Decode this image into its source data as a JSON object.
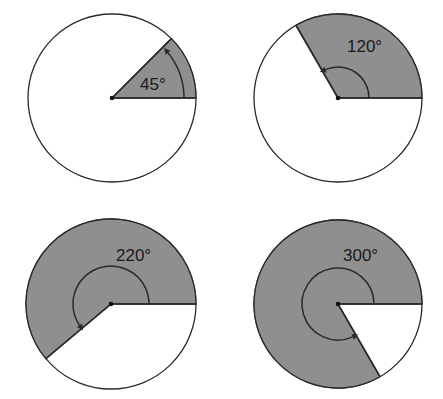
{
  "colors": {
    "background": "#ffffff",
    "sector_fill": "#8f8f8f",
    "stroke": "#2a2a2a"
  },
  "figures": [
    {
      "id": "angle-45",
      "angle_degrees": 45,
      "label": "45°",
      "center": [
        112,
        98
      ],
      "radius": 84,
      "arc_radius": 72,
      "label_pos": [
        140,
        90
      ]
    },
    {
      "id": "angle-120",
      "angle_degrees": 120,
      "label": "120°",
      "center": [
        338,
        98
      ],
      "radius": 84,
      "arc_radius": 31,
      "label_pos": [
        347,
        52
      ]
    },
    {
      "id": "angle-220",
      "angle_degrees": 220,
      "label": "220°",
      "center": [
        111,
        304
      ],
      "radius": 85,
      "arc_radius": 38,
      "label_pos": [
        116,
        261
      ]
    },
    {
      "id": "angle-300",
      "angle_degrees": 300,
      "label": "300°",
      "center": [
        338,
        304
      ],
      "radius": 84,
      "arc_radius": 36,
      "label_pos": [
        343,
        261
      ]
    }
  ]
}
